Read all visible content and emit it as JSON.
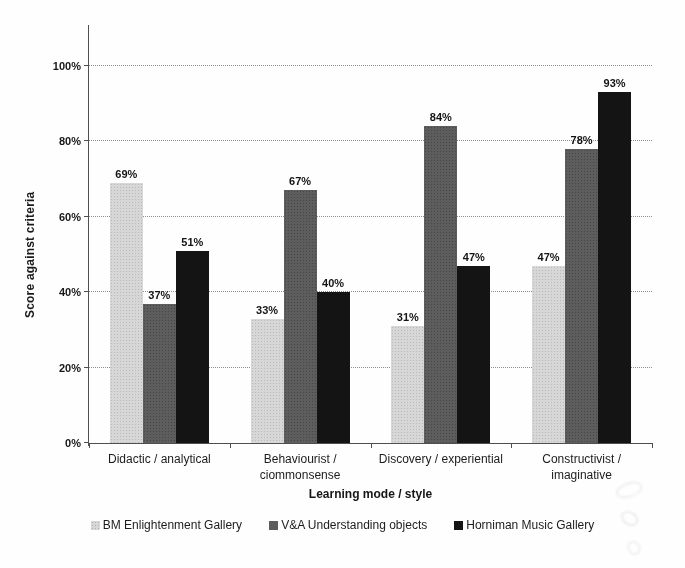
{
  "chart_data": {
    "type": "bar",
    "title": "",
    "categories": [
      "Didactic / analytical",
      "Behaviourist /\nciommonsense",
      "Discovery / experiential",
      "Constructivist /\nimaginative"
    ],
    "series": [
      {
        "name": "BM Enlightenment Gallery",
        "color": "#d7d7d7",
        "values": [
          69,
          33,
          31,
          47
        ],
        "value_labels": [
          "69%",
          "33%",
          "31%",
          "47%"
        ]
      },
      {
        "name": "V&A Understanding objects",
        "color": "#5d5d5d",
        "values": [
          37,
          67,
          84,
          78
        ],
        "value_labels": [
          "37%",
          "67%",
          "84%",
          "78%"
        ]
      },
      {
        "name": "Horniman Music Gallery",
        "color": "#141414",
        "values": [
          51,
          40,
          47,
          93
        ],
        "value_labels": [
          "51%",
          "40%",
          "47%",
          "93%"
        ]
      }
    ],
    "xlabel": "Learning mode / style",
    "ylabel": "Score against criteria",
    "ylim": [
      0,
      100
    ],
    "yticks": [
      {
        "value": 0,
        "label": "0%"
      },
      {
        "value": 20,
        "label": "20%"
      },
      {
        "value": 40,
        "label": "40%"
      },
      {
        "value": 60,
        "label": "60%"
      },
      {
        "value": 80,
        "label": "80%"
      },
      {
        "value": 100,
        "label": "100%"
      }
    ],
    "grid": true,
    "legend_position": "bottom"
  }
}
